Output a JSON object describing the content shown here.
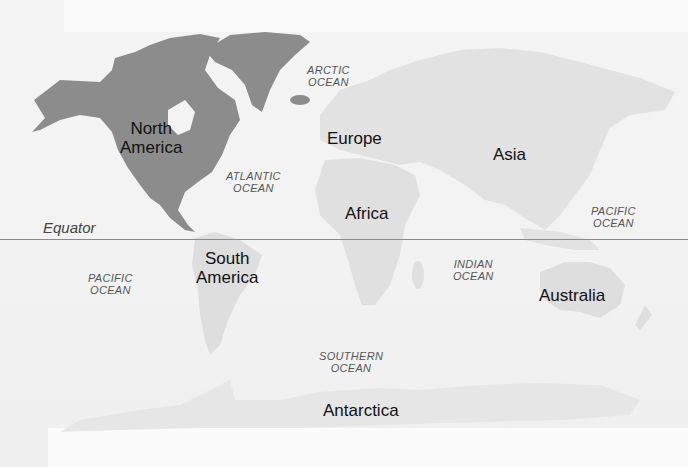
{
  "map": {
    "title": "World Map",
    "equator": {
      "label": "Equator"
    },
    "continents": [
      {
        "name": "North America",
        "line1": "North",
        "line2": "America"
      },
      {
        "name": "South America",
        "line1": "South",
        "line2": "America"
      },
      {
        "name": "Europe",
        "line1": "Europe"
      },
      {
        "name": "Africa",
        "line1": "Africa"
      },
      {
        "name": "Asia",
        "line1": "Asia"
      },
      {
        "name": "Australia",
        "line1": "Australia"
      },
      {
        "name": "Antarctica",
        "line1": "Antarctica"
      }
    ],
    "oceans": [
      {
        "name": "Arctic Ocean",
        "line1": "ARCTIC",
        "line2": "OCEAN"
      },
      {
        "name": "Atlantic Ocean",
        "line1": "ATLANTIC",
        "line2": "OCEAN"
      },
      {
        "name": "Pacific Ocean (east)",
        "line1": "PACIFIC",
        "line2": "OCEAN"
      },
      {
        "name": "Pacific Ocean (west)",
        "line1": "PACIFIC",
        "line2": "OCEAN"
      },
      {
        "name": "Indian Ocean",
        "line1": "INDIAN",
        "line2": "OCEAN"
      },
      {
        "name": "Southern Ocean",
        "line1": "SOUTHERN",
        "line2": "OCEAN"
      }
    ],
    "colors": {
      "highlighted_land": "#8c8c8c",
      "other_land": "#e2e2e2",
      "ocean": "#f3f3f3",
      "equator_line": "#8a8a8a"
    }
  }
}
